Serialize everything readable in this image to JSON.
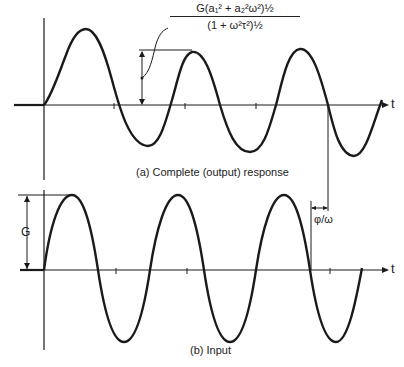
{
  "figure": {
    "panel_a": {
      "caption": "(a) Complete (output) response",
      "axis_label": "t",
      "amplitude_formula": {
        "numerator": "G(a₁² + a₂²ω²)½",
        "denominator": "(1 + ω²τ²)½"
      }
    },
    "panel_b": {
      "caption": "(b) Input",
      "axis_label": "t",
      "amplitude_label": "G"
    },
    "phase_shift_label": "φ/ω",
    "colors": {
      "stroke": "#1a1a1a",
      "background": "#ffffff"
    }
  }
}
